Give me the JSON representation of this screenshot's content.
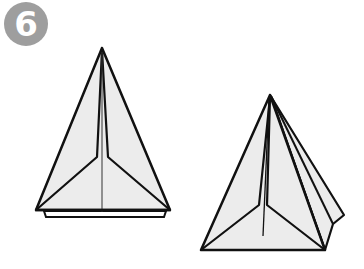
{
  "step": {
    "number": "6",
    "badge_color": "#9e9e9e",
    "text_color": "#ffffff"
  },
  "colors": {
    "paper_fill": "#ececec",
    "stroke": "#111111",
    "background": "#ffffff"
  },
  "figures": [
    {
      "name": "folded-kite-front-view",
      "description": "Triangular folded model, front view with center crease and inner folds"
    },
    {
      "name": "folded-kite-angled-view",
      "description": "Triangular folded model, angled 3D view showing side flaps"
    }
  ]
}
